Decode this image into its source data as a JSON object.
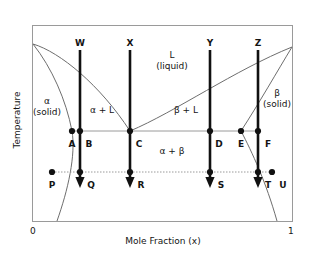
{
  "figure": {
    "type": "binary-eutectic-phase-diagram",
    "axes": {
      "y_title": "Temperature",
      "x_title": "Mole Fraction (x)",
      "x_tick_min": "0",
      "x_tick_max": "1"
    },
    "region_labels": [
      {
        "key": "alpha_solid",
        "line1": "α",
        "line2": "(solid)"
      },
      {
        "key": "beta_solid",
        "line1": "β",
        "line2": "(solid)"
      },
      {
        "key": "liquid",
        "line1": "L",
        "line2": "(liquid)"
      },
      {
        "key": "alpha_plus_l",
        "line1": "α + L",
        "line2": ""
      },
      {
        "key": "beta_plus_l",
        "line1": "β + L",
        "line2": ""
      },
      {
        "key": "alpha_plus_beta",
        "line1": "α + β",
        "line2": ""
      }
    ],
    "cooling_paths": [
      {
        "id": "W",
        "label": "W"
      },
      {
        "id": "X",
        "label": "X"
      },
      {
        "id": "Y",
        "label": "Y"
      },
      {
        "id": "Z",
        "label": "Z"
      }
    ],
    "points_eutectic_line": [
      {
        "id": "A",
        "label": "A"
      },
      {
        "id": "B",
        "label": "B"
      },
      {
        "id": "C",
        "label": "C"
      },
      {
        "id": "D",
        "label": "D"
      },
      {
        "id": "E",
        "label": "E"
      },
      {
        "id": "F",
        "label": "F"
      }
    ],
    "points_lower_line": [
      {
        "id": "P",
        "label": "P"
      },
      {
        "id": "Q",
        "label": "Q"
      },
      {
        "id": "R",
        "label": "R"
      },
      {
        "id": "S",
        "label": "S"
      },
      {
        "id": "T",
        "label": "T"
      },
      {
        "id": "U",
        "label": "U"
      }
    ],
    "colors": {
      "frame": "#9a9a9a",
      "curve": "#6e6e6e",
      "tieline": "#9a9a9a",
      "arrow": "#111111",
      "dot": "#111111",
      "text": "#141414",
      "background": "#ffffff"
    }
  }
}
